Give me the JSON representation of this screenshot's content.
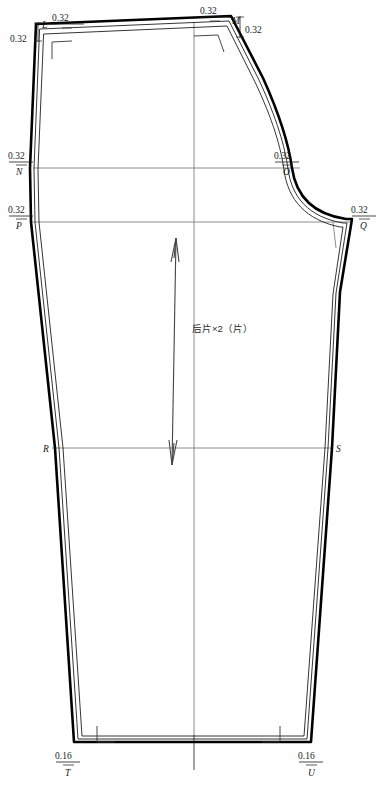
{
  "drawing": {
    "title": "后片×2（片）",
    "piece_label": "后片×2（片）",
    "background_color": "#ffffff",
    "line_color": "#000000",
    "aux_line_color": "#6e6e6e"
  },
  "points": [
    {
      "id": "L",
      "label": "L",
      "x": 39,
      "y": 30
    },
    {
      "id": "M",
      "label": "M",
      "x": 232,
      "y": 23
    },
    {
      "id": "N",
      "label": "N",
      "x": 33,
      "y": 168
    },
    {
      "id": "O",
      "label": "O",
      "x": 286,
      "y": 168
    },
    {
      "id": "P",
      "label": "P",
      "x": 31,
      "y": 222
    },
    {
      "id": "Q",
      "label": "Q",
      "x": 358,
      "y": 222
    },
    {
      "id": "R",
      "label": "R",
      "x": 51,
      "y": 448
    },
    {
      "id": "S",
      "label": "S",
      "x": 331,
      "y": 448
    },
    {
      "id": "T",
      "label": "T",
      "x": 73,
      "y": 770
    },
    {
      "id": "U",
      "label": "U",
      "x": 307,
      "y": 770
    }
  ],
  "dimensions": [
    {
      "id": "dim-L-top",
      "value": "0.32",
      "x": 63,
      "y": 21,
      "orientation": "horizontal"
    },
    {
      "id": "dim-L-left",
      "value": "0.32",
      "x": 14,
      "y": 41,
      "orientation": "vertical"
    },
    {
      "id": "dim-M-top",
      "value": "0.32",
      "x": 212,
      "y": 14,
      "orientation": "horizontal"
    },
    {
      "id": "dim-M-right",
      "value": "0.32",
      "x": 244,
      "y": 33,
      "orientation": "vertical"
    },
    {
      "id": "dim-N",
      "value": "0.32",
      "x": 15,
      "y": 157,
      "orientation": "horizontal"
    },
    {
      "id": "dim-O",
      "value": "0.32",
      "x": 286,
      "y": 157,
      "orientation": "horizontal"
    },
    {
      "id": "dim-P",
      "value": "0.32",
      "x": 15,
      "y": 211,
      "orientation": "horizontal"
    },
    {
      "id": "dim-Q",
      "value": "0.32",
      "x": 360,
      "y": 211,
      "orientation": "horizontal"
    },
    {
      "id": "dim-T",
      "value": "0.16",
      "x": 70,
      "y": 757,
      "orientation": "horizontal"
    },
    {
      "id": "dim-U",
      "value": "0.16",
      "x": 310,
      "y": 757,
      "orientation": "horizontal"
    }
  ],
  "dimension_values": {
    "seam_allowance_major": "0.32",
    "seam_allowance_hem": "0.16"
  }
}
